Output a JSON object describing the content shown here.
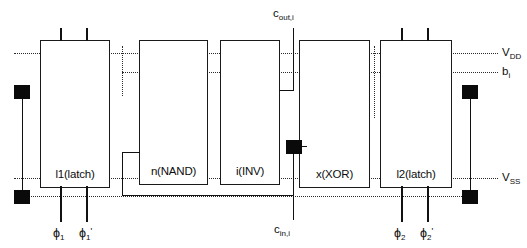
{
  "diagram": {
    "blocks": [
      {
        "id": "l1",
        "label": "l1(latch)"
      },
      {
        "id": "nand",
        "label": "n(NAND)"
      },
      {
        "id": "inv",
        "label": "i(INV)"
      },
      {
        "id": "xor",
        "label": "x(XOR)"
      },
      {
        "id": "l2",
        "label": "l2(latch)"
      }
    ],
    "rails": [
      {
        "id": "vdd",
        "label_main": "V",
        "label_sub": "DD"
      },
      {
        "id": "bi",
        "label_main": "b",
        "label_sub": "i"
      },
      {
        "id": "vss",
        "label_main": "V",
        "label_sub": "SS"
      }
    ],
    "signals": {
      "carry_out_main": "c",
      "carry_out_sub": "out,i",
      "carry_in_main": "c",
      "carry_in_sub": "in,i"
    },
    "clocks": [
      {
        "id": "phi1",
        "glyph": "ϕ",
        "sub": "1",
        "prime": ""
      },
      {
        "id": "phi1p",
        "glyph": "ϕ",
        "sub": "1",
        "prime": "'"
      },
      {
        "id": "phi2",
        "glyph": "ϕ",
        "sub": "2",
        "prime": ""
      },
      {
        "id": "phi2p",
        "glyph": "ϕ",
        "sub": "2",
        "prime": "'"
      }
    ],
    "colors": {
      "ink": "#111111",
      "rail": "#2a2a2a",
      "background": "#ffffff"
    }
  }
}
